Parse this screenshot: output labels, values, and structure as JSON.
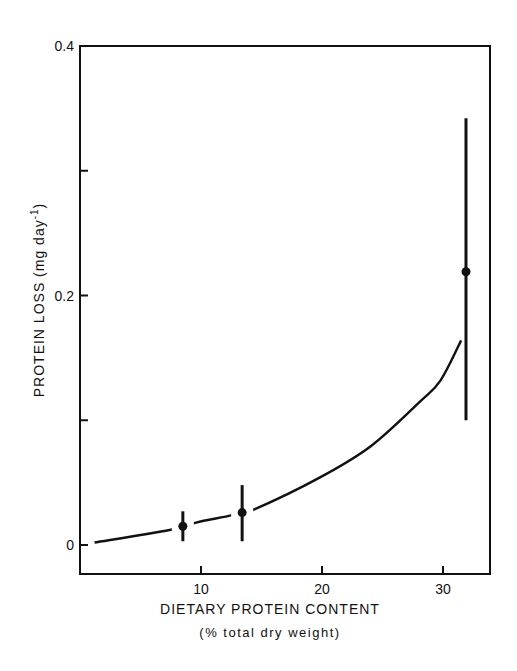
{
  "chart_data": {
    "type": "scatter",
    "title": "",
    "xlabel": "DIETARY PROTEIN CONTENT",
    "xlabel_sub": "(% total dry weight)",
    "ylabel": "PROTEIN LOSS (mg day⁻¹)",
    "xlim": [
      0,
      33.8
    ],
    "ylim": [
      -0.023,
      0.4
    ],
    "x_ticks": [
      10,
      20,
      30
    ],
    "x_tick_labels": [
      "10",
      "20",
      "30"
    ],
    "y_ticks": [
      0,
      0.1,
      0.2,
      0.3,
      0.4
    ],
    "y_tick_labels": [
      "0",
      "",
      "0.2",
      "",
      "0.4"
    ],
    "grid": false,
    "legend": null,
    "series": [
      {
        "name": "observed (mean ± error)",
        "type": "scatter_errorbar",
        "points": [
          {
            "x": 8.5,
            "y": 0.015,
            "y_low": 0.003,
            "y_high": 0.027
          },
          {
            "x": 13.4,
            "y": 0.026,
            "y_low": 0.003,
            "y_high": 0.048
          },
          {
            "x": 31.9,
            "y": 0.219,
            "y_low": 0.1,
            "y_high": 0.342
          }
        ]
      },
      {
        "name": "fitted curve",
        "type": "line",
        "x": [
          1.2,
          7.4,
          9.6,
          12.6,
          14.5,
          19.8,
          24.0,
          28.1,
          29.8,
          31.5
        ],
        "y": [
          0.002,
          0.012,
          0.018,
          0.024,
          0.029,
          0.054,
          0.079,
          0.115,
          0.132,
          0.164
        ]
      }
    ]
  },
  "labels": {
    "xlabel": "DIETARY PROTEIN CONTENT",
    "xlabel_sub": "(% total dry weight)",
    "ylabel_main": "PROTEIN LOSS (mg day",
    "ylabel_sup": "-1",
    "ylabel_close": ")"
  },
  "colors": {
    "ink": "#111111",
    "background": "#ffffff"
  }
}
